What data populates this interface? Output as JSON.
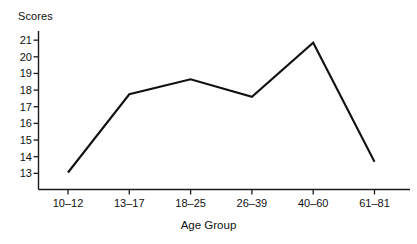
{
  "chart_data": {
    "type": "line",
    "title": "",
    "xlabel": "Age Group",
    "ylabel": "Scores",
    "categories": [
      "10–12",
      "13–17",
      "18–25",
      "26–39",
      "40–60",
      "61–81"
    ],
    "values": [
      13.05,
      17.75,
      18.65,
      17.6,
      20.85,
      13.7
    ],
    "series": [
      {
        "name": "Scores",
        "values": [
          13.05,
          17.75,
          18.65,
          17.6,
          20.85,
          13.7
        ]
      }
    ],
    "ytick_labels": [
      "21",
      "20",
      "19",
      "18",
      "17",
      "16",
      "15",
      "14",
      "13"
    ],
    "ytick_values": [
      21,
      20,
      19,
      18,
      17,
      16,
      15,
      14,
      13
    ],
    "ylim": [
      12.3,
      21.55
    ],
    "grid": false,
    "legend": false,
    "legend_position": "none",
    "line_color": "#111111",
    "axis_color": "#1b1b1b",
    "background_color": "#ffffff"
  }
}
